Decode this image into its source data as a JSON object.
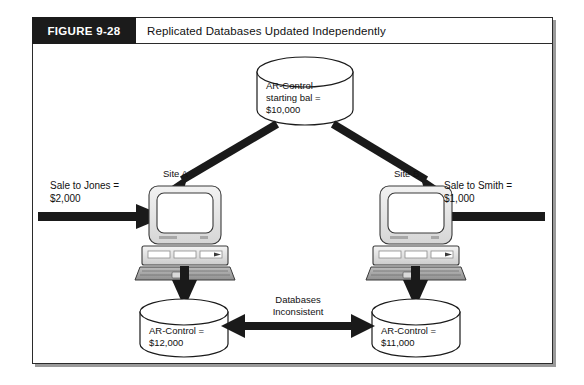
{
  "figure": {
    "tag": "FIGURE 9-28",
    "title": "Replicated Databases Updated Independently"
  },
  "colors": {
    "tag_background": "#1b1b1b",
    "tag_text": "#ffffff",
    "frame_border": "#2b2b2b",
    "arrow": "#1a1a1a",
    "cylinder_fill": "#ffffff",
    "cylinder_stroke": "#1a1a1a",
    "computer_body": "#e8e8e8",
    "computer_stroke": "#3a3a3a",
    "screen_fill": "#ffffff",
    "shadow": "#9a9a9a"
  },
  "diagram": {
    "type": "flow-diagram",
    "nodes": {
      "master_db": {
        "kind": "database-cylinder",
        "line1": "AR-Control",
        "line2": "starting bal =",
        "line3": "$10,000"
      },
      "site_a": {
        "kind": "computer",
        "label": "Site A"
      },
      "site_b": {
        "kind": "computer",
        "label": "Site B"
      },
      "db_a": {
        "kind": "database-cylinder",
        "line1": "AR-Control =",
        "line2": "$12,000"
      },
      "db_b": {
        "kind": "database-cylinder",
        "line1": "AR-Control =",
        "line2": "$11,000"
      }
    },
    "annotations": {
      "left_input_line1": "Sale to Jones =",
      "left_input_line2": "$2,000",
      "right_input_line1": "Sale to Smith =",
      "right_input_line2": "$1,000",
      "middle_line1": "Databases",
      "middle_line2": "Inconsistent"
    },
    "edges": [
      {
        "from": "master_db",
        "to": "site_a",
        "style": "thick-arrow-diagonal"
      },
      {
        "from": "master_db",
        "to": "site_b",
        "style": "thick-arrow-diagonal"
      },
      {
        "from": "left_input",
        "to": "site_a",
        "style": "thick-arrow-right"
      },
      {
        "from": "right_input",
        "to": "site_b",
        "style": "thick-arrow-left"
      },
      {
        "from": "site_a",
        "to": "db_a",
        "style": "thick-arrow-down"
      },
      {
        "from": "site_b",
        "to": "db_b",
        "style": "thick-arrow-down"
      },
      {
        "from": "db_a",
        "to": "db_b",
        "style": "thick-arrow-double"
      }
    ]
  }
}
